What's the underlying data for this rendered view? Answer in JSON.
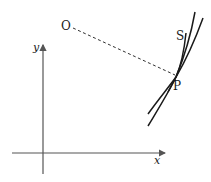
{
  "diagram": {
    "type": "geometry-figure",
    "labels": {
      "origin_point": "O",
      "contact_point": "P",
      "curve_label": "S",
      "x_axis": "x",
      "y_axis": "y"
    },
    "colors": {
      "ink": "#1a1a1a",
      "axis": "#555555",
      "background": "#ffffff"
    },
    "elements": {
      "axes": {
        "origin": [
          43,
          153
        ],
        "x_end": [
          165,
          153
        ],
        "y_end": [
          43,
          44
        ]
      },
      "dashed_segment": {
        "from": "O",
        "to": "P",
        "style": "dashed"
      },
      "curves_through_P": 3
    }
  }
}
